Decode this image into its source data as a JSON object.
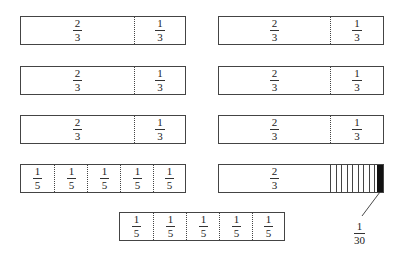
{
  "diagram": {
    "rows": [
      {
        "left": {
          "segments": [
            {
              "num": "2",
              "den": "3"
            },
            {
              "num": "1",
              "den": "3"
            }
          ]
        },
        "right": {
          "segments": [
            {
              "num": "2",
              "den": "3"
            },
            {
              "num": "1",
              "den": "3"
            }
          ]
        }
      },
      {
        "left": {
          "segments": [
            {
              "num": "2",
              "den": "3"
            },
            {
              "num": "1",
              "den": "3"
            }
          ]
        },
        "right": {
          "segments": [
            {
              "num": "2",
              "den": "3"
            },
            {
              "num": "1",
              "den": "3"
            }
          ]
        }
      },
      {
        "left": {
          "segments": [
            {
              "num": "2",
              "den": "3"
            },
            {
              "num": "1",
              "den": "3"
            }
          ]
        },
        "right": {
          "segments": [
            {
              "num": "2",
              "den": "3"
            },
            {
              "num": "1",
              "den": "3"
            }
          ]
        }
      },
      {
        "left": {
          "segments": [
            {
              "num": "1",
              "den": "5"
            },
            {
              "num": "1",
              "den": "5"
            },
            {
              "num": "1",
              "den": "5"
            },
            {
              "num": "1",
              "den": "5"
            },
            {
              "num": "1",
              "den": "5"
            }
          ]
        },
        "right": {
          "segments": [
            {
              "num": "2",
              "den": "3"
            }
          ],
          "hatched_subdivisions": 10,
          "highlighted_subdivisions": 1
        }
      }
    ],
    "bottom": {
      "segments": [
        {
          "num": "1",
          "den": "5"
        },
        {
          "num": "1",
          "den": "5"
        },
        {
          "num": "1",
          "den": "5"
        },
        {
          "num": "1",
          "den": "5"
        },
        {
          "num": "1",
          "den": "5"
        }
      ]
    },
    "callout": {
      "num": "1",
      "den": "30"
    },
    "colors": {
      "stroke": "#444444",
      "highlight": "#111111",
      "background": "#ffffff"
    }
  }
}
